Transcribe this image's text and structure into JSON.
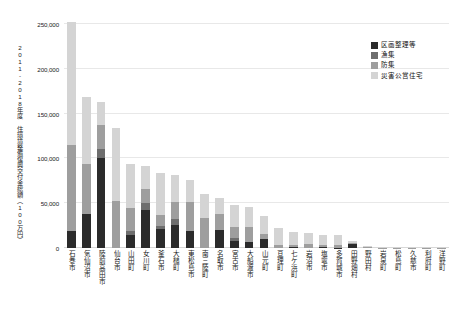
{
  "chart_data": {
    "type": "bar",
    "subtype": "stacked-vertical",
    "title": "",
    "xlabel": "",
    "ylabel": "2011-2018年度 住環境整備復興交付金総額（100万円）",
    "ylim": [
      0,
      250000
    ],
    "ytick_labels": [
      "0",
      "50,000",
      "100,000",
      "150,000",
      "200,000",
      "250,000"
    ],
    "ytick_values": [
      0,
      50000,
      100000,
      150000,
      200000,
      250000
    ],
    "grid": true,
    "legend_position": "top-right",
    "categories": [
      "石巻市",
      "気仙沼市",
      "陸前高田市",
      "仙台市",
      "山田町",
      "女川町",
      "釜石市",
      "大槌町",
      "東松島市",
      "南三陸町",
      "名取市",
      "宮古市",
      "大船渡市",
      "山元町",
      "亘理町",
      "七ケ浜町",
      "岩沼市",
      "塩竈市",
      "多賀城市",
      "田野畑村",
      "野田村",
      "岩泉町",
      "松島町",
      "久慈市",
      "利府町",
      "洋野町"
    ],
    "series": [
      {
        "name": "区画整理等",
        "color": "#2b2b2b",
        "values": [
          19000,
          38000,
          100000,
          0,
          14000,
          42000,
          21000,
          26000,
          19000,
          0,
          20000,
          7500,
          6500,
          10000,
          0,
          1500,
          0,
          800,
          500,
          4500,
          600,
          200,
          0,
          0,
          0,
          0
        ]
      },
      {
        "name": "漁集",
        "color": "#6e6e6e",
        "values": [
          0,
          0,
          10000,
          0,
          4500,
          8000,
          4000,
          6000,
          0,
          0,
          0,
          4000,
          0,
          0,
          0,
          0,
          0,
          0,
          0,
          0,
          0,
          0,
          0,
          0,
          0,
          0
        ]
      },
      {
        "name": "防集",
        "color": "#9e9e9e",
        "values": [
          96000,
          56000,
          27000,
          52000,
          26000,
          16000,
          12000,
          19000,
          32000,
          33000,
          18000,
          12000,
          17000,
          6000,
          3000,
          1500,
          5000,
          2500,
          2500,
          1500,
          400,
          300,
          300,
          200,
          200,
          200
        ]
      },
      {
        "name": "災害公営住宅",
        "color": "#d4d4d4",
        "values": [
          137000,
          74000,
          26000,
          82000,
          49000,
          26000,
          47000,
          30000,
          25000,
          27000,
          18000,
          24000,
          22000,
          20000,
          19000,
          15000,
          12000,
          11000,
          12000,
          2000,
          1500,
          1000,
          800,
          500,
          400,
          400
        ]
      }
    ]
  },
  "legend": {
    "items": [
      {
        "label": "区画整理等"
      },
      {
        "label": "漁集"
      },
      {
        "label": "防集"
      },
      {
        "label": "災害公営住宅"
      }
    ]
  }
}
